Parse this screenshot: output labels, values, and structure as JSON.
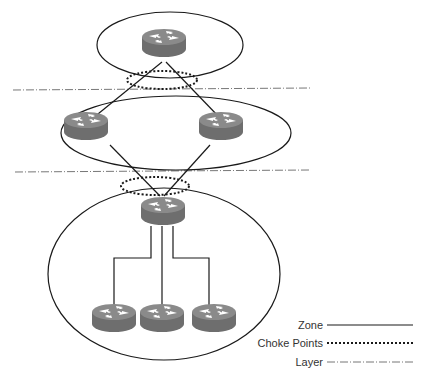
{
  "diagram": {
    "colors": {
      "line": "#1a1a1a",
      "router_top": "#8a8a8a",
      "router_side": "#6e6e6e",
      "router_arrow": "#ffffff",
      "layer_line": "#777777"
    },
    "zones": [
      {
        "id": "top-zone",
        "routers": 1
      },
      {
        "id": "middle-zone",
        "routers": 2
      },
      {
        "id": "bottom-zone",
        "routers": 4
      }
    ],
    "choke_points": 2,
    "layers": 2
  },
  "legend": {
    "zone": "Zone",
    "choke_points": "Choke Points",
    "layer": "Layer"
  }
}
